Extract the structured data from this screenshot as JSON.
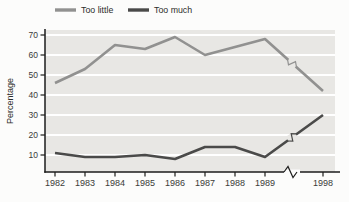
{
  "chart_data": {
    "type": "line",
    "title": "",
    "xlabel": "",
    "ylabel": "Percentage",
    "x": [
      1982,
      1983,
      1984,
      1985,
      1986,
      1987,
      1988,
      1989,
      1998
    ],
    "x_tick_labels": [
      "1982",
      "1983",
      "1984",
      "1985",
      "1986",
      "1987",
      "1988",
      "1989",
      "1998"
    ],
    "y_ticks": [
      10,
      20,
      30,
      40,
      50,
      60,
      70
    ],
    "ylim": [
      0,
      75
    ],
    "grid": true,
    "legend_position": "top",
    "axis_break_between": [
      1989,
      1998
    ],
    "series": [
      {
        "name": "Too little",
        "color": "#919190",
        "values": [
          46,
          53,
          65,
          63,
          69,
          60,
          64,
          68,
          42
        ]
      },
      {
        "name": "Too much",
        "color": "#4a4a49",
        "values": [
          11,
          9,
          9,
          10,
          8,
          14,
          14,
          9,
          30
        ]
      }
    ]
  },
  "colors": {
    "panel_bg": "#e8e7e4",
    "gridline": "#ffffff",
    "axis": "#1d1d1c",
    "tick_label": "#3a3a38",
    "legend_label": "#2c2c2a"
  }
}
